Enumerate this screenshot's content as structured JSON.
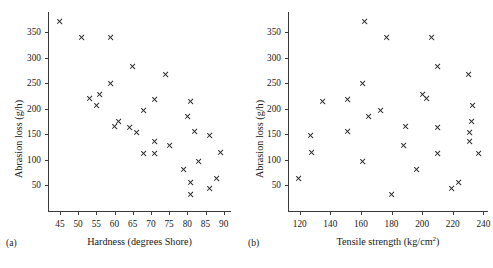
{
  "figure": {
    "background": "#ffffff",
    "marker_color": "#2a2a2a",
    "axis_color": "#3a3a3a",
    "marker_symbol": "x"
  },
  "chart_data": [
    {
      "type": "scatter",
      "panel_tag": "(a)",
      "title": "",
      "xlabel": "Hardness (degrees Shore)",
      "ylabel": "Abrasion loss (g/h)",
      "xlim": [
        42,
        92
      ],
      "ylim": [
        0,
        390
      ],
      "xticks": [
        45,
        50,
        55,
        60,
        65,
        70,
        75,
        80,
        85,
        90
      ],
      "yticks": [
        50,
        100,
        150,
        200,
        250,
        300,
        350
      ],
      "grid": false,
      "legend": null,
      "x": [
        45,
        55,
        61,
        66,
        71,
        71,
        81,
        86,
        53,
        60,
        64,
        68,
        79,
        81,
        56,
        68,
        75,
        83,
        88,
        59,
        71,
        80,
        82,
        89,
        51,
        59,
        65,
        74,
        81,
        86
      ],
      "y": [
        372,
        206,
        175,
        154,
        136,
        112,
        55,
        45,
        221,
        166,
        164,
        113,
        82,
        32,
        228,
        196,
        128,
        97,
        64,
        249,
        219,
        186,
        155,
        114,
        341,
        340,
        283,
        267,
        215,
        148
      ]
    },
    {
      "type": "scatter",
      "panel_tag": "(b)",
      "title": "",
      "xlabel": "Tensile strength (kg/cm2)",
      "xlabel_html": "Tensile strength (kg/cm<sup>2</sup>)",
      "ylabel": "Abrasion loss (g/h)",
      "xlim": [
        113,
        243
      ],
      "ylim": [
        0,
        390
      ],
      "xticks": [
        120,
        140,
        160,
        180,
        200,
        220,
        240
      ],
      "yticks": [
        50,
        100,
        150,
        200,
        250,
        300,
        350
      ],
      "grid": false,
      "legend": null,
      "x": [
        162,
        233,
        232,
        231,
        231,
        237,
        224,
        219,
        203,
        189,
        210,
        210,
        196,
        180,
        200,
        173,
        188,
        161,
        119,
        161,
        151,
        165,
        151,
        128,
        206,
        177,
        210,
        230,
        135,
        127
      ],
      "y": [
        372,
        206,
        175,
        154,
        136,
        112,
        55,
        45,
        221,
        166,
        164,
        113,
        82,
        32,
        228,
        196,
        128,
        97,
        64,
        249,
        219,
        186,
        155,
        114,
        341,
        340,
        283,
        267,
        215,
        148
      ]
    }
  ]
}
